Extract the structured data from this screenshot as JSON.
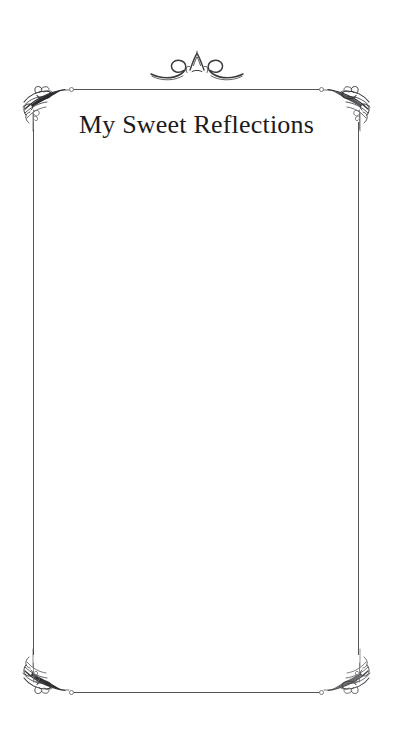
{
  "page": {
    "background_color": "#ffffff",
    "width": 393,
    "height": 735
  },
  "header": {
    "title": "My Sweet Reflections",
    "title_color": "#1b1b1b"
  },
  "ornaments": {
    "top_flourish": {
      "name": "top-center-flourish",
      "description": "symmetric scroll flourish with small crown",
      "color": "#3b3b3f"
    },
    "corners": [
      {
        "name": "corner-ornament-top-left",
        "color": "#2f2f33"
      },
      {
        "name": "corner-ornament-top-right",
        "color": "#2f2f33"
      },
      {
        "name": "corner-ornament-bottom-left",
        "color": "#2f2f33"
      },
      {
        "name": "corner-ornament-bottom-right",
        "color": "#2f2f33"
      }
    ],
    "frame": {
      "rule_color": "#4c4e53",
      "node_color": "#7a7d82"
    }
  },
  "writing_area": {
    "placeholder": "",
    "value": ""
  }
}
